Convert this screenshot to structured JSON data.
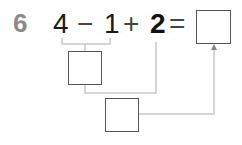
{
  "problem": {
    "number": "6",
    "tokens": {
      "a": "4",
      "op1": "−",
      "b": "1",
      "op2": "+",
      "c": "2",
      "eq": "="
    },
    "boxes": {
      "step1": "",
      "step2": "",
      "answer": ""
    }
  },
  "colors": {
    "number": "#8a8a8a",
    "text": "#1a1a1a",
    "box_border": "#555555",
    "connector": "#c8c8c8"
  }
}
